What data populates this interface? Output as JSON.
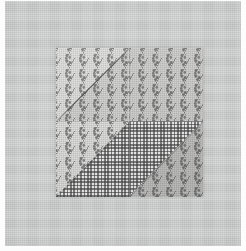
{
  "image": {
    "subject": "Patchwork quilt block",
    "description": "Grayscale photograph of a four-patch quilt block made of floral print and gingham check cotton fabrics, laid flat on a plain light gray cloth background",
    "orientation": "portrait",
    "color_mode": "grayscale",
    "width_px": 246,
    "height_px": 251
  },
  "background": {
    "name": "plain gray cloth backdrop",
    "color": "#cfd0d0",
    "margin_color": "#fdfdfd"
  },
  "quilt_block": {
    "label": "four-patch quilt block",
    "left_px": 56,
    "top_px": 48,
    "width_px": 147,
    "height_px": 149,
    "patches": [
      {
        "position": "top-left",
        "name": "patch-top-left",
        "fabric_upper": "floral print (light)",
        "fabric_lower": "floral print (medium)",
        "division": "diagonal seam from bottom-left to top-right",
        "color_upper": "#cdcdcb",
        "color_lower": "#c8c8c6"
      },
      {
        "position": "top-right",
        "name": "patch-top-right",
        "fabric_upper": "floral print (medium)",
        "fabric_lower": "floral print (medium)",
        "division": "none — single fabric square",
        "color_upper": "#c6c6c4",
        "color_lower": "#c6c6c4"
      },
      {
        "position": "bottom-left",
        "name": "patch-bottom-left",
        "fabric_upper": "floral print (light)",
        "fabric_lower": "gingham check",
        "division": "half-square triangle, diagonal bottom-left to top-right",
        "color_upper": "#cdcdcb",
        "color_lower": "#e8e8e6"
      },
      {
        "position": "bottom-right",
        "name": "patch-bottom-right",
        "fabric_upper": "gingham check",
        "fabric_lower": "floral print (medium)",
        "division": "half-square triangle, diagonal bottom-left to top-right",
        "color_upper": "#e8e8e6",
        "color_lower": "#c6c6c4"
      }
    ],
    "fabrics": {
      "floral": {
        "name": "floral sprig print",
        "ground_color": "#c6c6c4",
        "motif_color": "#6f6f70",
        "motif_spacing_px": "14 x 15"
      },
      "gingham": {
        "name": "gingham check",
        "ground_color": "#e8e8e6",
        "line_color": "#3c3c3e",
        "check_pitch_px": "3.4"
      }
    },
    "seams": [
      {
        "name": "vertical-center-seam",
        "orientation": "vertical"
      },
      {
        "name": "horizontal-center-seam",
        "orientation": "horizontal"
      },
      {
        "name": "diagonal-seam-top-left",
        "orientation": "diagonal"
      },
      {
        "name": "diagonal-seam-bottom-left",
        "orientation": "diagonal"
      },
      {
        "name": "diagonal-seam-bottom-right",
        "orientation": "diagonal"
      }
    ]
  }
}
